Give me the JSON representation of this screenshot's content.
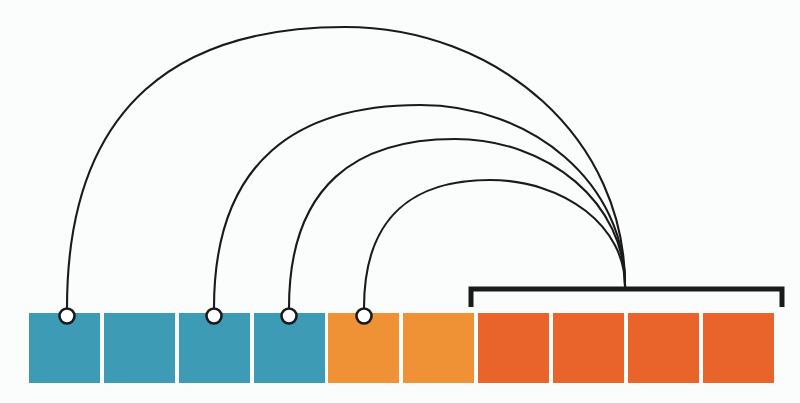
{
  "figure": {
    "canvas": {
      "width": 800,
      "height": 403,
      "background": "#fbfcfc"
    }
  },
  "palette": {
    "teal": "#3d9bb5",
    "light_orange": "#ef9135",
    "dark_orange": "#e8642a",
    "stroke": "#1a1a1a",
    "marker_fill": "#ffffff",
    "background": "#fbfcfc"
  },
  "cell_row": {
    "name": "sequence-cell-row",
    "count": 10,
    "cell_width": 71,
    "cell_height": 70,
    "pitch": 74.8,
    "origin_x": 29,
    "origin_y": 313,
    "cells": [
      {
        "index": 1,
        "x": 29,
        "color": "#3d9bb5",
        "group": "teal",
        "has_marker": true,
        "marker_cx": 67,
        "marker_cy": 316
      },
      {
        "index": 2,
        "x": 104,
        "color": "#3d9bb5",
        "group": "teal",
        "has_marker": false,
        "marker_cx": null,
        "marker_cy": null
      },
      {
        "index": 3,
        "x": 179,
        "color": "#3d9bb5",
        "group": "teal",
        "has_marker": true,
        "marker_cx": 214,
        "marker_cy": 316
      },
      {
        "index": 4,
        "x": 254,
        "color": "#3d9bb5",
        "group": "teal",
        "has_marker": true,
        "marker_cx": 289,
        "marker_cy": 316
      },
      {
        "index": 5,
        "x": 328,
        "color": "#ef9135",
        "group": "light-orange",
        "has_marker": true,
        "marker_cx": 364,
        "marker_cy": 316
      },
      {
        "index": 6,
        "x": 403,
        "color": "#ef9135",
        "group": "light-orange",
        "has_marker": false,
        "marker_cx": null,
        "marker_cy": null
      },
      {
        "index": 7,
        "x": 478,
        "color": "#e8642a",
        "group": "dark-orange",
        "has_marker": false,
        "marker_cx": null,
        "marker_cy": null
      },
      {
        "index": 8,
        "x": 553,
        "color": "#e8642a",
        "group": "dark-orange",
        "has_marker": false,
        "marker_cx": null,
        "marker_cy": null
      },
      {
        "index": 9,
        "x": 628,
        "color": "#e8642a",
        "group": "dark-orange",
        "has_marker": false,
        "marker_cx": null,
        "marker_cy": null
      },
      {
        "index": 10,
        "x": 703,
        "color": "#e8642a",
        "group": "dark-orange",
        "has_marker": false,
        "marker_cx": null,
        "marker_cy": null
      }
    ]
  },
  "marker": {
    "name": "attachment-circle-marker",
    "radius": 7.5,
    "stroke_width": 2.6,
    "stroke": "#1a1a1a",
    "fill": "#ffffff"
  },
  "bracket": {
    "name": "span-bracket",
    "left_x": 471,
    "right_x": 782,
    "top_y": 289,
    "tick_bottom_y": 307,
    "stroke_width": 5,
    "stroke": "#1a1a1a",
    "converge_x": 625,
    "converge_y": 289
  },
  "arcs": {
    "name": "connection-arcs",
    "stroke": "#1a1a1a",
    "stroke_width": 2.1,
    "target_x": 625,
    "target_y": 289,
    "items": [
      {
        "index": 1,
        "source_cell": 1,
        "start_x": 67,
        "start_y": 308,
        "apex_x": 345,
        "apex_y": 27,
        "label": "arc-cell-1"
      },
      {
        "index": 2,
        "source_cell": 3,
        "start_x": 214,
        "start_y": 308,
        "apex_x": 420,
        "apex_y": 105,
        "label": "arc-cell-3"
      },
      {
        "index": 3,
        "source_cell": 4,
        "start_x": 289,
        "start_y": 308,
        "apex_x": 455,
        "apex_y": 139,
        "label": "arc-cell-4"
      },
      {
        "index": 4,
        "source_cell": 5,
        "start_x": 364,
        "start_y": 308,
        "apex_x": 490,
        "apex_y": 180,
        "label": "arc-cell-5"
      }
    ]
  },
  "chart_data": {
    "type": "diagram",
    "xlabel": "",
    "ylabel": "",
    "legend": [],
    "nodes": [
      {
        "id": 1,
        "color": "#3d9bb5",
        "group": "teal"
      },
      {
        "id": 2,
        "color": "#3d9bb5",
        "group": "teal"
      },
      {
        "id": 3,
        "color": "#3d9bb5",
        "group": "teal"
      },
      {
        "id": 4,
        "color": "#3d9bb5",
        "group": "teal"
      },
      {
        "id": 5,
        "color": "#ef9135",
        "group": "light-orange"
      },
      {
        "id": 6,
        "color": "#ef9135",
        "group": "light-orange"
      },
      {
        "id": 7,
        "color": "#e8642a",
        "group": "dark-orange"
      },
      {
        "id": 8,
        "color": "#e8642a",
        "group": "dark-orange"
      },
      {
        "id": 9,
        "color": "#e8642a",
        "group": "dark-orange"
      },
      {
        "id": 10,
        "color": "#e8642a",
        "group": "dark-orange"
      }
    ],
    "edges": [
      {
        "from": 1,
        "to": "bracket-group"
      },
      {
        "from": 3,
        "to": "bracket-group"
      },
      {
        "from": 4,
        "to": "bracket-group"
      },
      {
        "from": 5,
        "to": "bracket-group"
      }
    ],
    "groups": [
      {
        "name": "bracket-group",
        "member_cells": [
          7,
          8,
          9,
          10
        ],
        "span_start_x": 471,
        "span_end_x": 782
      }
    ]
  }
}
